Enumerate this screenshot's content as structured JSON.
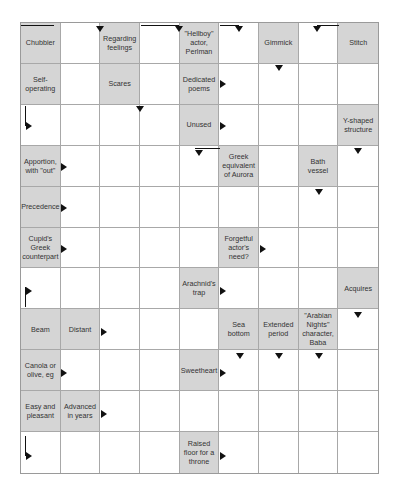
{
  "puzzle": {
    "type": "arrowword",
    "cols": 9,
    "rows": 11,
    "colors": {
      "clue_bg": "#d5d5d5",
      "grid_line": "#a8a8a8",
      "arrow": "#111111",
      "entry_bg": "#ffffff"
    },
    "clues": [
      {
        "r": 0,
        "c": 0,
        "text": "Chubbier"
      },
      {
        "r": 0,
        "c": 2,
        "text": "Regarding feelings"
      },
      {
        "r": 0,
        "c": 4,
        "text": "\"Hellboy\" actor, Perlman"
      },
      {
        "r": 0,
        "c": 6,
        "text": "Gimmick"
      },
      {
        "r": 0,
        "c": 8,
        "text": "Stitch"
      },
      {
        "r": 1,
        "c": 0,
        "text": "Self-operating"
      },
      {
        "r": 1,
        "c": 2,
        "text": "Scares"
      },
      {
        "r": 1,
        "c": 4,
        "text": "Dedicated poems"
      },
      {
        "r": 2,
        "c": 4,
        "text": "Unused"
      },
      {
        "r": 2,
        "c": 8,
        "text": "Y-shaped structure"
      },
      {
        "r": 3,
        "c": 0,
        "text": "Apportion, with \"out\""
      },
      {
        "r": 3,
        "c": 5,
        "text": "Greek equivalent of Aurora"
      },
      {
        "r": 3,
        "c": 7,
        "text": "Bath vessel"
      },
      {
        "r": 4,
        "c": 0,
        "text": "Precedence"
      },
      {
        "r": 5,
        "c": 0,
        "text": "Cupid's Greek counterpart"
      },
      {
        "r": 5,
        "c": 5,
        "text": "Forgetful actor's need?"
      },
      {
        "r": 6,
        "c": 4,
        "text": "Arachnid's trap"
      },
      {
        "r": 6,
        "c": 8,
        "text": "Acquires"
      },
      {
        "r": 7,
        "c": 0,
        "text": "Beam"
      },
      {
        "r": 7,
        "c": 1,
        "text": "Distant"
      },
      {
        "r": 7,
        "c": 5,
        "text": "Sea bottom"
      },
      {
        "r": 7,
        "c": 6,
        "text": "Extended period"
      },
      {
        "r": 7,
        "c": 7,
        "text": "\"Arabian Nights\" character, Baba"
      },
      {
        "r": 8,
        "c": 0,
        "text": "Canola or olive, eg"
      },
      {
        "r": 8,
        "c": 4,
        "text": "Sweetheart"
      },
      {
        "r": 9,
        "c": 0,
        "text": "Easy and pleasant"
      },
      {
        "r": 9,
        "c": 1,
        "text": "Advanced in years"
      },
      {
        "r": 10,
        "c": 4,
        "text": "Raised floor for a throne"
      }
    ],
    "arrows": [
      {
        "name": "down-arrow-r0c1",
        "dir": "down",
        "x": 75,
        "y": 3,
        "line": {
          "x": 0,
          "y": 2,
          "w": 33,
          "h": 1
        }
      },
      {
        "name": "down-arrow-r0c3",
        "dir": "down",
        "x": 154,
        "y": 3,
        "line": {
          "x": 120,
          "y": 2,
          "w": 38,
          "h": 1
        }
      },
      {
        "name": "down-arrow-r0c5",
        "dir": "down",
        "x": 214,
        "y": 3,
        "line": {
          "x": 199,
          "y": 2,
          "w": 19,
          "h": 1
        }
      },
      {
        "name": "down-arrow-r0c7",
        "dir": "down",
        "x": 292,
        "y": 3,
        "line": {
          "x": 296,
          "y": 2,
          "w": 22,
          "h": 1
        }
      },
      {
        "name": "right-arrow-r1c4",
        "dir": "right",
        "x": 199,
        "y": 57
      },
      {
        "name": "down-arrow-r1c6",
        "dir": "down",
        "x": 254,
        "y": 42
      },
      {
        "name": "right-arrow-r2c0",
        "dir": "right",
        "x": 5,
        "y": 99,
        "line": {
          "x": 4,
          "y": 83,
          "w": 1,
          "h": 20
        }
      },
      {
        "name": "down-arrow-r2c2",
        "dir": "down",
        "x": 115,
        "y": 83
      },
      {
        "name": "right-arrow-r2c4",
        "dir": "right",
        "x": 199,
        "y": 99
      },
      {
        "name": "right-arrow-r3c0",
        "dir": "right",
        "x": 40,
        "y": 140
      },
      {
        "name": "down-arrow-r3c4",
        "dir": "down",
        "x": 174,
        "y": 127,
        "line": {
          "x": 174,
          "y": 125,
          "w": 25,
          "h": 1
        }
      },
      {
        "name": "down-arrow-r3c8",
        "dir": "down",
        "x": 333,
        "y": 125
      },
      {
        "name": "right-arrow-r4c0",
        "dir": "right",
        "x": 40,
        "y": 181
      },
      {
        "name": "down-arrow-r4c7",
        "dir": "down",
        "x": 294,
        "y": 166
      },
      {
        "name": "right-arrow-r5c0",
        "dir": "right",
        "x": 40,
        "y": 222
      },
      {
        "name": "right-arrow-r5c5",
        "dir": "right",
        "x": 239,
        "y": 222
      },
      {
        "name": "right-arrow-r6c0",
        "dir": "right",
        "x": 5,
        "y": 264,
        "line": {
          "x": 4,
          "y": 264,
          "w": 1,
          "h": 20
        }
      },
      {
        "name": "right-arrow-r6c4",
        "dir": "right",
        "x": 199,
        "y": 264
      },
      {
        "name": "down-arrow-r7c8",
        "dir": "down",
        "x": 333,
        "y": 289
      },
      {
        "name": "right-arrow-r7c1",
        "dir": "right",
        "x": 80,
        "y": 305
      },
      {
        "name": "down-arrow-r8c5",
        "dir": "down",
        "x": 215,
        "y": 330
      },
      {
        "name": "down-arrow-r8c6",
        "dir": "down",
        "x": 254,
        "y": 330
      },
      {
        "name": "down-arrow-r8c7",
        "dir": "down",
        "x": 294,
        "y": 330
      },
      {
        "name": "right-arrow-r8c0",
        "dir": "right",
        "x": 40,
        "y": 346
      },
      {
        "name": "right-arrow-r8c4",
        "dir": "right",
        "x": 199,
        "y": 346
      },
      {
        "name": "right-arrow-r9c1",
        "dir": "right",
        "x": 80,
        "y": 387
      },
      {
        "name": "right-arrow-r10c0",
        "dir": "right",
        "x": 5,
        "y": 429,
        "line": {
          "x": 4,
          "y": 413,
          "w": 1,
          "h": 20
        }
      },
      {
        "name": "right-arrow-r10c4",
        "dir": "right",
        "x": 199,
        "y": 429
      }
    ]
  }
}
